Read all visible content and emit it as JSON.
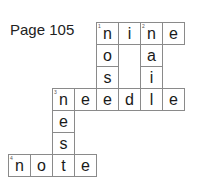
{
  "page_label": "Page 105",
  "crossword": {
    "clues": [
      {
        "number": "1",
        "direction": "across",
        "answer": "nine"
      },
      {
        "number": "1",
        "direction": "down",
        "answer": "nose"
      },
      {
        "number": "2",
        "direction": "down",
        "answer": "nail"
      },
      {
        "number": "3",
        "direction": "across",
        "answer": "needle"
      },
      {
        "number": "3",
        "direction": "down",
        "answer": "nest"
      },
      {
        "number": "4",
        "direction": "across",
        "answer": "note"
      }
    ],
    "cells": [
      {
        "letter": "n",
        "num": "1"
      },
      {
        "letter": "i",
        "num": ""
      },
      {
        "letter": "n",
        "num": "2"
      },
      {
        "letter": "e",
        "num": ""
      },
      {
        "letter": "o",
        "num": ""
      },
      {
        "letter": "a",
        "num": ""
      },
      {
        "letter": "s",
        "num": ""
      },
      {
        "letter": "i",
        "num": ""
      },
      {
        "letter": "n",
        "num": "3"
      },
      {
        "letter": "e",
        "num": ""
      },
      {
        "letter": "e",
        "num": ""
      },
      {
        "letter": "d",
        "num": ""
      },
      {
        "letter": "l",
        "num": ""
      },
      {
        "letter": "e",
        "num": ""
      },
      {
        "letter": "e",
        "num": ""
      },
      {
        "letter": "s",
        "num": ""
      },
      {
        "letter": "n",
        "num": "4"
      },
      {
        "letter": "o",
        "num": ""
      },
      {
        "letter": "t",
        "num": ""
      },
      {
        "letter": "e",
        "num": ""
      }
    ]
  }
}
